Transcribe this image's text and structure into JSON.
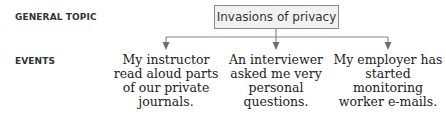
{
  "labels": {
    "general_topic": "GENERAL TOPIC",
    "events": "EVENTS"
  },
  "topic": "Invasions of privacy",
  "events": [
    {
      "text": "My instructor read aloud parts of our private journals."
    },
    {
      "text": "An interviewer asked me very personal questions."
    },
    {
      "text": "My employer has started monitoring worker e-mails."
    }
  ],
  "colors": {
    "line": "#8a8a8a",
    "box_fill": "#f1f1f1",
    "text": "#222222"
  }
}
